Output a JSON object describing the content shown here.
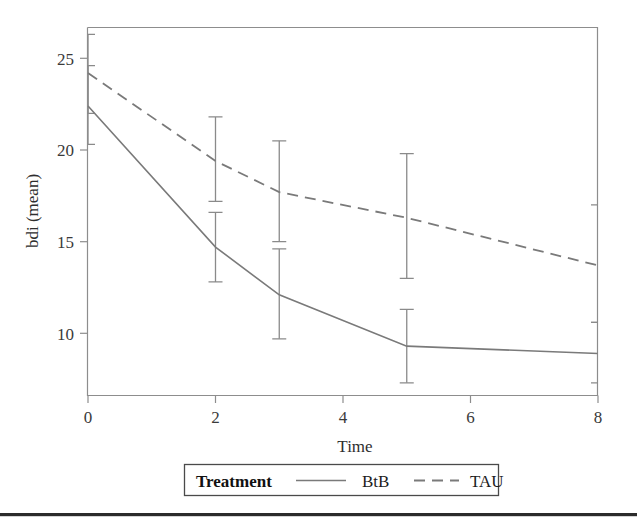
{
  "figure": {
    "background": "#ffffff",
    "line_color": "#7a7a7a",
    "text_color": "#2e2e2e"
  },
  "chart_data": {
    "type": "line",
    "title": "",
    "xlabel": "Time",
    "ylabel": "bdi (mean)",
    "x": [
      0,
      2,
      3,
      5,
      8
    ],
    "xlim": [
      -0.35,
      8.35
    ],
    "ylim": [
      7.2,
      26.6
    ],
    "xticks": [
      0,
      2,
      4,
      6,
      8
    ],
    "xtick_labels": [
      "0",
      "2",
      "4",
      "6",
      "8"
    ],
    "yticks": [
      10,
      15,
      20,
      25
    ],
    "ytick_labels": [
      "10",
      "15",
      "20",
      "25"
    ],
    "grid": false,
    "legend_position": "below-axes",
    "legend_title": "Treatment",
    "series": [
      {
        "name": "BtB",
        "style": "solid",
        "values": [
          22.4,
          14.7,
          12.1,
          9.3,
          8.9
        ],
        "err_low": [
          20.3,
          12.8,
          9.7,
          7.3,
          7.3
        ],
        "err_high": [
          24.6,
          16.6,
          14.6,
          11.3,
          10.6
        ]
      },
      {
        "name": "TAU",
        "style": "dashed",
        "values": [
          24.2,
          19.4,
          17.7,
          16.3,
          13.7
        ],
        "err_low": [
          22.0,
          17.2,
          15.0,
          13.0,
          10.6
        ],
        "err_high": [
          26.3,
          21.8,
          20.5,
          19.8,
          17.0
        ]
      }
    ]
  },
  "legend": {
    "title": "Treatment",
    "entries": [
      {
        "label": "BtB",
        "style": "solid"
      },
      {
        "label": "TAU",
        "style": "dashed"
      }
    ]
  },
  "axis": {
    "x_label": "Time",
    "y_label": "bdi (mean)",
    "x_tick_labels": [
      "0",
      "2",
      "4",
      "6",
      "8"
    ],
    "y_tick_labels": [
      "10",
      "15",
      "20",
      "25"
    ]
  }
}
